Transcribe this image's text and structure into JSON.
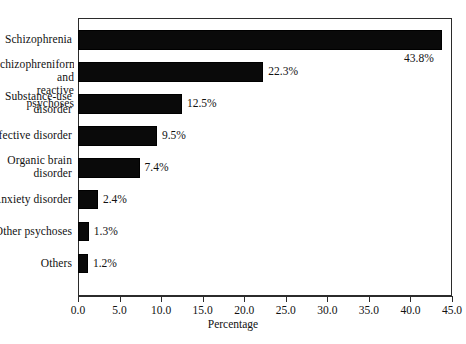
{
  "chart_data": {
    "type": "bar",
    "orientation": "horizontal",
    "title": "",
    "xlabel": "Percentage",
    "ylabel": "",
    "xlim": [
      0.0,
      45.0
    ],
    "xticks": [
      "0.0",
      "5.0",
      "10.0",
      "15.0",
      "20.0",
      "25.0",
      "30.0",
      "35.0",
      "40.0",
      "45.0"
    ],
    "xtick_values": [
      0,
      5,
      10,
      15,
      20,
      25,
      30,
      35,
      40,
      45
    ],
    "grid": false,
    "legend": false,
    "bar_color": "#0a0a0a",
    "background_color": "#ffffff",
    "categories": [
      "Schizophrenia",
      "chizophreniform and\nreactive psychoses",
      "Substance-use\ndisorder",
      "Affective disorder",
      "Organic brain\ndisorder",
      "Anxiety disorder",
      "Other psychoses",
      "Others"
    ],
    "values": [
      43.8,
      22.3,
      12.5,
      9.5,
      7.4,
      2.4,
      1.3,
      1.2
    ],
    "value_labels": [
      "43.8%",
      "22.3%",
      "12.5%",
      "9.5%",
      "7.4%",
      "2.4%",
      "1.3%",
      "1.2%"
    ]
  }
}
